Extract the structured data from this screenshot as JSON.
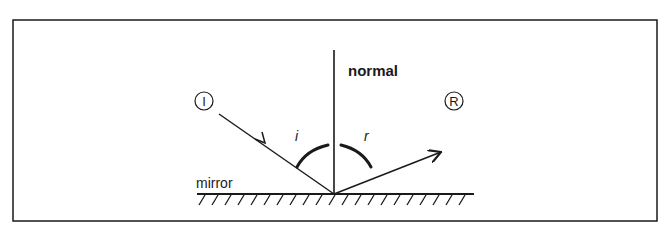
{
  "diagram": {
    "labels": {
      "normal": "normal",
      "mirror": "mirror",
      "incidence_angle": "i",
      "reflection_angle": "r",
      "incident_ray_marker": "I",
      "reflected_ray_marker": "R"
    },
    "colors": {
      "stroke": "#1a1a1a",
      "background": "#ffffff"
    }
  }
}
